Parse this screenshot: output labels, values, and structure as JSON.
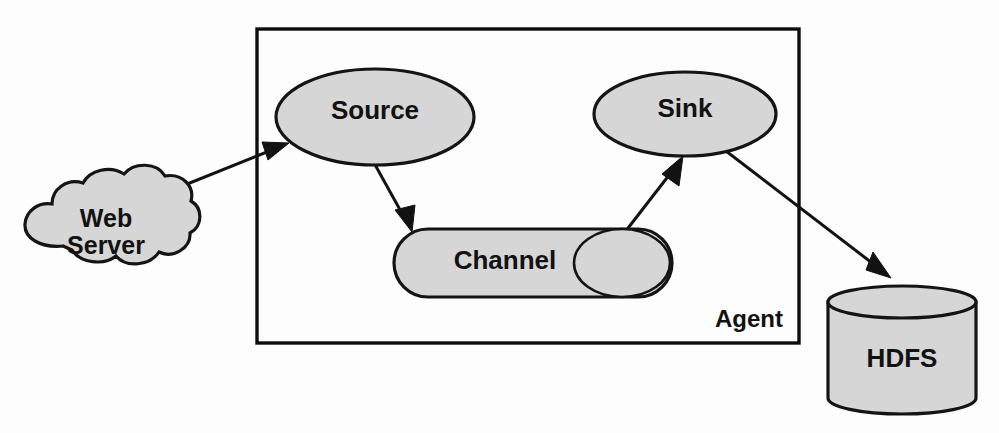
{
  "diagram": {
    "type": "flow-diagram",
    "background_color": "#fdfdfd",
    "shape_fill_color": "#d6d6d6",
    "shape_stroke_color": "#141414",
    "nodes": {
      "web_server": {
        "label_line1": "Web",
        "label_line2": "Server",
        "shape": "cloud"
      },
      "source": {
        "label": "Source",
        "shape": "ellipse"
      },
      "channel": {
        "label": "Channel",
        "shape": "horizontal-cylinder"
      },
      "sink": {
        "label": "Sink",
        "shape": "ellipse"
      },
      "hdfs": {
        "label": "HDFS",
        "shape": "vertical-cylinder"
      },
      "agent": {
        "label": "Agent",
        "shape": "rectangle-container"
      }
    },
    "edges": [
      {
        "from": "web_server",
        "to": "source",
        "style": "arrow"
      },
      {
        "from": "source",
        "to": "channel",
        "style": "arrow"
      },
      {
        "from": "channel",
        "to": "sink",
        "style": "arrow"
      },
      {
        "from": "sink",
        "to": "hdfs",
        "style": "arrow"
      }
    ]
  }
}
